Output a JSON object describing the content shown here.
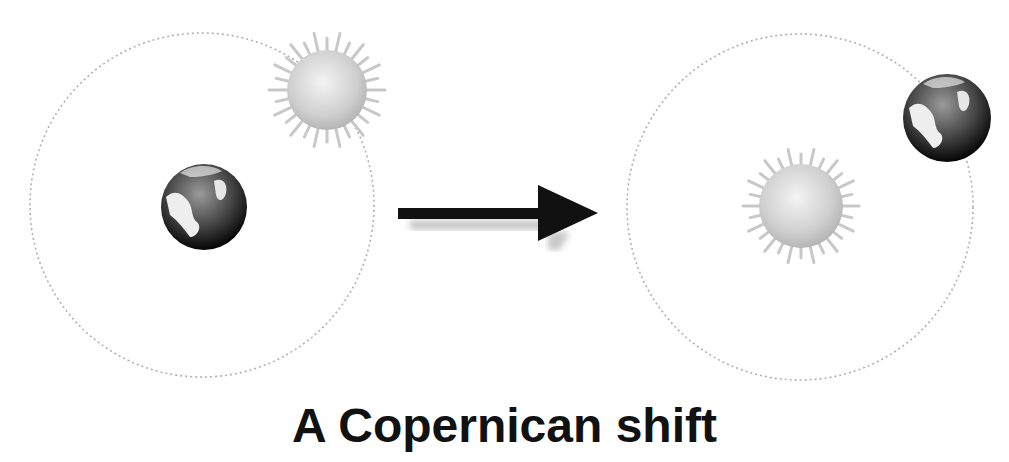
{
  "caption": "A Copernican shift",
  "colors": {
    "background": "#ffffff",
    "orbit": "#b0b0b0",
    "arrow": "#111111",
    "text": "#111111"
  },
  "panels": [
    {
      "name": "geocentric",
      "center_body": "earth",
      "orbiting_body": "sun"
    },
    {
      "name": "heliocentric",
      "center_body": "sun",
      "orbiting_body": "earth"
    }
  ],
  "icons": [
    "sun-icon",
    "earth-icon",
    "arrow-right-icon"
  ]
}
